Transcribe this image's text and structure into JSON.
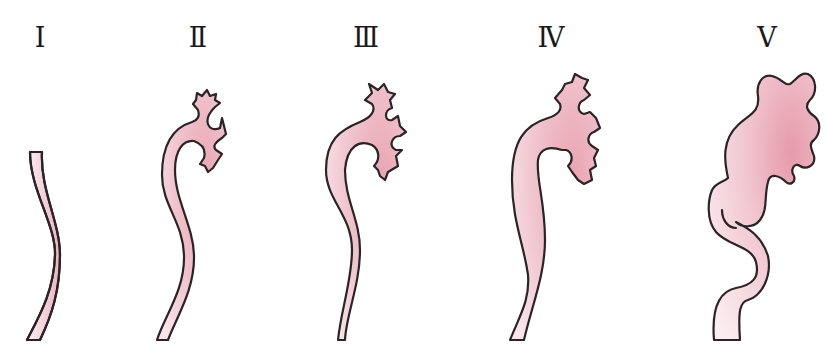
{
  "diagram": {
    "colors": {
      "fill_light": "#f8e6ea",
      "fill_dark": "#e9a9b5",
      "outline": "#2a2426",
      "background": "#ffffff"
    },
    "grades": [
      {
        "label": "Ⅰ",
        "x": 40
      },
      {
        "label": "Ⅱ",
        "x": 198
      },
      {
        "label": "Ⅲ",
        "x": 366
      },
      {
        "label": "Ⅳ",
        "x": 551
      },
      {
        "label": "Ⅴ",
        "x": 767
      }
    ]
  }
}
